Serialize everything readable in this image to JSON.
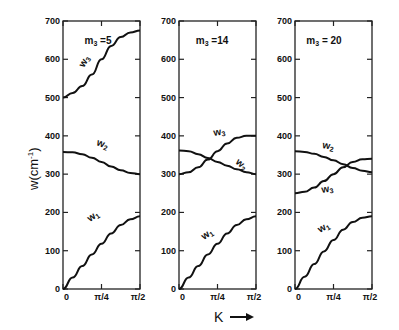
{
  "chart_data": [
    {
      "type": "line",
      "title": "m3 =5",
      "xlabel": "K",
      "ylabel": "w(cm-1)",
      "ylim": [
        0,
        700
      ],
      "xlim": [
        0,
        1.5708
      ],
      "xticks": [
        "0",
        "π/4",
        "π/2"
      ],
      "yticks": [
        "0",
        "100",
        "200",
        "300",
        "400",
        "500",
        "600",
        "700"
      ],
      "x": [
        0,
        0.125,
        0.25,
        0.375,
        0.5,
        0.625,
        0.75,
        0.875,
        1.0
      ],
      "series": [
        {
          "name": "w1",
          "values": [
            0,
            30,
            60,
            90,
            118,
            145,
            167,
            182,
            190
          ]
        },
        {
          "name": "w2",
          "values": [
            358,
            357,
            352,
            343,
            332,
            320,
            310,
            303,
            300
          ]
        },
        {
          "name": "w3",
          "values": [
            500,
            512,
            530,
            560,
            600,
            635,
            658,
            670,
            675
          ]
        }
      ]
    },
    {
      "type": "line",
      "title": "m3 =14",
      "xlabel": "K",
      "ylabel": "w(cm-1)",
      "ylim": [
        0,
        700
      ],
      "xlim": [
        0,
        1.5708
      ],
      "xticks": [
        "0",
        "π/4",
        "π/2"
      ],
      "yticks": [
        "0",
        "100",
        "200",
        "300",
        "400",
        "500",
        "600",
        "700"
      ],
      "x": [
        0,
        0.125,
        0.25,
        0.375,
        0.5,
        0.625,
        0.75,
        0.875,
        1.0
      ],
      "series": [
        {
          "name": "w1",
          "values": [
            0,
            30,
            60,
            90,
            118,
            145,
            167,
            182,
            190
          ]
        },
        {
          "name": "w2",
          "values": [
            362,
            360,
            352,
            342,
            332,
            322,
            313,
            305,
            300
          ]
        },
        {
          "name": "w3",
          "values": [
            300,
            305,
            318,
            338,
            360,
            380,
            395,
            400,
            400
          ]
        }
      ]
    },
    {
      "type": "line",
      "title": "m3 = 20",
      "xlabel": "K",
      "ylabel": "w(cm-1)",
      "ylim": [
        0,
        700
      ],
      "xlim": [
        0,
        1.5708
      ],
      "xticks": [
        "0",
        "π/4",
        "π/2"
      ],
      "yticks": [
        "0",
        "100",
        "200",
        "300",
        "400",
        "500",
        "600",
        "700"
      ],
      "x": [
        0,
        0.125,
        0.25,
        0.375,
        0.5,
        0.625,
        0.75,
        0.875,
        1.0
      ],
      "series": [
        {
          "name": "w1",
          "values": [
            0,
            32,
            65,
            98,
            128,
            155,
            175,
            186,
            190
          ]
        },
        {
          "name": "w2",
          "values": [
            360,
            358,
            353,
            345,
            336,
            326,
            316,
            309,
            305
          ]
        },
        {
          "name": "w3",
          "values": [
            250,
            254,
            265,
            282,
            300,
            318,
            332,
            339,
            340
          ]
        }
      ]
    }
  ],
  "labels": {
    "ylabel": "w(cm",
    "ylabel_sup": "-1",
    "ylabel_close": ")",
    "xlabel": "K",
    "panel_titles": [
      "m3 =5",
      "m3 =14",
      "m3 = 20"
    ],
    "curve_labels": [
      "w1",
      "w2",
      "w3"
    ]
  }
}
